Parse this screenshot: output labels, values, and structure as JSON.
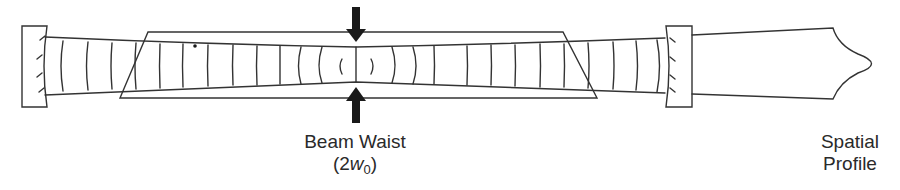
{
  "diagram": {
    "colors": {
      "stroke": "#333333",
      "arrow": "#1a1a1a",
      "text": "#2a2a2a",
      "background": "#ffffff"
    },
    "labels": {
      "beam_waist": {
        "line1": "Beam Waist",
        "line2_open": "(2",
        "line2_var": "w",
        "line2_sub": "0",
        "line2_close": ")"
      },
      "spatial_profile": {
        "line1": "Spatial",
        "line2": "Profile"
      }
    },
    "components": [
      {
        "name": "left-mirror",
        "type": "concave mirror (high reflector)"
      },
      {
        "name": "gain-medium",
        "type": "trapezoidal crystal (Brewster-cut)"
      },
      {
        "name": "beam-waist-arrows",
        "type": "pair of arrows indicating waist"
      },
      {
        "name": "right-mirror",
        "type": "concave mirror (output coupler)"
      },
      {
        "name": "output-beam",
        "type": "output beam with spatial profile"
      }
    ]
  }
}
